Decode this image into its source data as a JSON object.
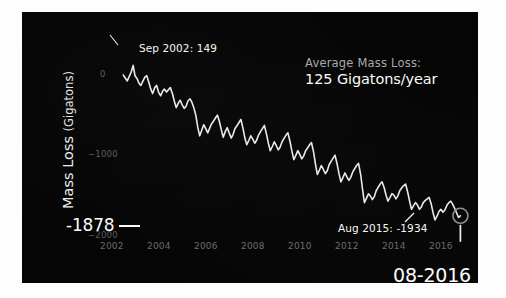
{
  "figure": {
    "background_color": "#050505",
    "frame_color": "#fdfdfd",
    "line_color": "#e8e8e8"
  },
  "axes": {
    "y_title_main": "Mass Loss",
    "y_title_unit": "(Gigatons)",
    "y_ticks": [
      {
        "label": "0",
        "value": 0
      },
      {
        "label": "−1000",
        "value": -1000
      },
      {
        "label": "−2000",
        "value": -2000
      }
    ],
    "x_ticks": [
      {
        "label": "2002",
        "value": 2002
      },
      {
        "label": "2004",
        "value": 2004
      },
      {
        "label": "2006",
        "value": 2006
      },
      {
        "label": "2008",
        "value": 2008
      },
      {
        "label": "2010",
        "value": 2010
      },
      {
        "label": "2012",
        "value": 2012
      },
      {
        "label": "2014",
        "value": 2014
      },
      {
        "label": "2016",
        "value": 2016
      }
    ],
    "xlim": [
      2001.6,
      2016.9
    ],
    "ylim": [
      -2150,
      330
    ]
  },
  "annotations": {
    "peak_label": "Sep 2002: 149",
    "average_label": "Average Mass Loss:",
    "average_value": "125 Gigatons/year",
    "last_label": "Aug 2015: -1934",
    "current_value_label": "-1878",
    "date_stamp": "08-2016"
  },
  "chart_data": {
    "type": "line",
    "title": "",
    "subtitle": "",
    "xlabel": "",
    "ylabel": "Mass Loss (Gigatons)",
    "xlim": [
      2001.6,
      2016.9
    ],
    "ylim": [
      -2150,
      330
    ],
    "grid": false,
    "legend_position": "none",
    "annotations": [
      {
        "text": "Sep 2002: 149",
        "x": 2002.71,
        "y": 149
      },
      {
        "text": "Average Mass Loss: 125 Gigatons/year",
        "x": 2009.5,
        "y": 120
      },
      {
        "text": "Aug 2015: -1934",
        "x": 2015.63,
        "y": -1934
      },
      {
        "text": "-1878",
        "x": 2016.62,
        "y": -1878
      },
      {
        "text": "08-2016",
        "x": 2016.62,
        "y": -2050
      }
    ],
    "marker": {
      "x": 2016.62,
      "y": -1878,
      "shape": "circle-open"
    },
    "series": [
      {
        "name": "Greenland ice mass anomaly",
        "unit": "Gigatons",
        "x": [
          2002.29,
          2002.46,
          2002.63,
          2002.71,
          2002.79,
          2002.88,
          2002.96,
          2003.04,
          2003.13,
          2003.21,
          2003.29,
          2003.38,
          2003.46,
          2003.54,
          2003.63,
          2003.71,
          2003.79,
          2003.88,
          2003.96,
          2004.04,
          2004.13,
          2004.21,
          2004.29,
          2004.38,
          2004.46,
          2004.54,
          2004.63,
          2004.71,
          2004.79,
          2004.88,
          2004.96,
          2005.04,
          2005.13,
          2005.21,
          2005.29,
          2005.38,
          2005.46,
          2005.54,
          2005.63,
          2005.71,
          2005.79,
          2005.88,
          2005.96,
          2006.04,
          2006.13,
          2006.21,
          2006.29,
          2006.38,
          2006.46,
          2006.54,
          2006.63,
          2006.71,
          2006.79,
          2006.88,
          2006.96,
          2007.04,
          2007.13,
          2007.21,
          2007.29,
          2007.38,
          2007.46,
          2007.54,
          2007.63,
          2007.71,
          2007.79,
          2007.88,
          2007.96,
          2008.04,
          2008.13,
          2008.21,
          2008.29,
          2008.38,
          2008.46,
          2008.54,
          2008.63,
          2008.71,
          2008.79,
          2008.88,
          2008.96,
          2009.04,
          2009.13,
          2009.21,
          2009.29,
          2009.38,
          2009.46,
          2009.54,
          2009.63,
          2009.71,
          2009.79,
          2009.88,
          2009.96,
          2010.04,
          2010.13,
          2010.21,
          2010.29,
          2010.38,
          2010.46,
          2010.54,
          2010.63,
          2010.71,
          2010.79,
          2010.88,
          2010.96,
          2011.04,
          2011.13,
          2011.21,
          2011.29,
          2011.38,
          2011.46,
          2011.54,
          2011.63,
          2011.71,
          2011.79,
          2011.88,
          2011.96,
          2012.04,
          2012.13,
          2012.21,
          2012.29,
          2012.38,
          2012.46,
          2012.54,
          2012.63,
          2012.71,
          2012.79,
          2012.88,
          2012.96,
          2013.04,
          2013.13,
          2013.21,
          2013.29,
          2013.38,
          2013.46,
          2013.54,
          2013.63,
          2013.71,
          2013.79,
          2013.88,
          2013.96,
          2014.04,
          2014.13,
          2014.21,
          2014.29,
          2014.38,
          2014.46,
          2014.54,
          2014.63,
          2014.71,
          2014.79,
          2014.88,
          2014.96,
          2015.04,
          2015.13,
          2015.21,
          2015.29,
          2015.38,
          2015.46,
          2015.54,
          2015.63,
          2015.71,
          2015.79,
          2015.88,
          2015.96,
          2016.04,
          2016.13,
          2016.21,
          2016.29,
          2016.38,
          2016.46,
          2016.54,
          2016.62
        ],
        "y": [
          20,
          -60,
          60,
          149,
          10,
          -30,
          -90,
          -120,
          -60,
          -10,
          10,
          -80,
          -170,
          -230,
          -150,
          -120,
          -210,
          -260,
          -200,
          -170,
          -210,
          -180,
          -150,
          -230,
          -330,
          -420,
          -360,
          -320,
          -380,
          -430,
          -400,
          -330,
          -300,
          -350,
          -420,
          -530,
          -690,
          -800,
          -720,
          -650,
          -700,
          -760,
          -700,
          -640,
          -600,
          -560,
          -520,
          -610,
          -720,
          -820,
          -740,
          -690,
          -760,
          -830,
          -780,
          -700,
          -660,
          -620,
          -580,
          -700,
          -830,
          -920,
          -860,
          -800,
          -840,
          -900,
          -860,
          -790,
          -740,
          -700,
          -660,
          -780,
          -900,
          -1000,
          -940,
          -880,
          -930,
          -990,
          -950,
          -880,
          -830,
          -790,
          -760,
          -880,
          -1010,
          -1120,
          -1060,
          -1000,
          -1050,
          -1110,
          -1070,
          -1000,
          -960,
          -920,
          -890,
          -1020,
          -1180,
          -1320,
          -1260,
          -1200,
          -1250,
          -1310,
          -1270,
          -1190,
          -1140,
          -1100,
          -1060,
          -1180,
          -1310,
          -1420,
          -1360,
          -1300,
          -1350,
          -1400,
          -1360,
          -1290,
          -1240,
          -1200,
          -1170,
          -1320,
          -1520,
          -1700,
          -1640,
          -1580,
          -1610,
          -1660,
          -1620,
          -1540,
          -1490,
          -1450,
          -1420,
          -1500,
          -1600,
          -1680,
          -1630,
          -1580,
          -1600,
          -1650,
          -1610,
          -1540,
          -1500,
          -1470,
          -1450,
          -1560,
          -1680,
          -1790,
          -1740,
          -1700,
          -1730,
          -1790,
          -1760,
          -1700,
          -1670,
          -1650,
          -1630,
          -1720,
          -1840,
          -1934,
          -1880,
          -1820,
          -1790,
          -1830,
          -1800,
          -1740,
          -1700,
          -1680,
          -1720,
          -1780,
          -1840,
          -1900,
          -1878
        ]
      }
    ]
  }
}
